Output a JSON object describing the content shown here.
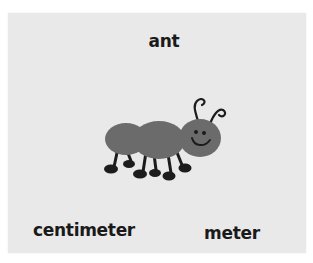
{
  "card": {
    "background": "#e9e9e9",
    "title": "ant",
    "illustration": "ant-illustration",
    "options": [
      {
        "label": "centimeter"
      },
      {
        "label": "meter"
      }
    ]
  },
  "colors": {
    "ant_body": "#6b6b6b",
    "ant_legs": "#1c1c1c",
    "text": "#1a1a1a"
  }
}
